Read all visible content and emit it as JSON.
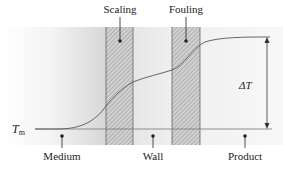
{
  "diagram": {
    "type": "temperature-profile",
    "labels": {
      "scaling": "Scaling",
      "fouling": "Fouling",
      "medium": "Medium",
      "wall": "Wall",
      "product": "Product",
      "tm_main": "T",
      "tm_sub": "m",
      "delta_t": "ΔT"
    },
    "regions": [
      {
        "name": "Medium",
        "x_start": 35,
        "x_end": 106
      },
      {
        "name": "Scaling",
        "x_start": 106,
        "x_end": 133,
        "hatched": true
      },
      {
        "name": "Wall",
        "x_start": 133,
        "x_end": 172
      },
      {
        "name": "Fouling",
        "x_start": 172,
        "x_end": 200,
        "hatched": true
      },
      {
        "name": "Product",
        "x_start": 200,
        "x_end": 283
      }
    ],
    "colors": {
      "hatch_bg": "#cfcfcf",
      "hatch_line": "#8a8a8a",
      "band_border": "#555555",
      "curve": "#555555",
      "baseline": "#777777",
      "text": "#222222"
    }
  }
}
